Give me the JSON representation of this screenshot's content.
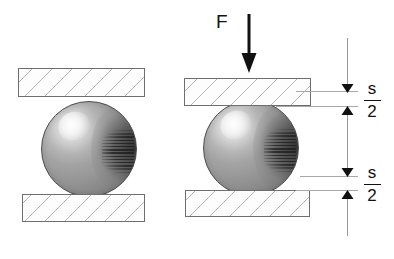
{
  "figure": {
    "background_color": "#ffffff",
    "force": {
      "label": "F",
      "direction": "down"
    },
    "dimensions": [
      {
        "id": "upper",
        "numerator": "s",
        "denominator": "2",
        "label": "s/2"
      },
      {
        "id": "lower",
        "numerator": "s",
        "denominator": "2",
        "label": "s/2"
      }
    ],
    "panels": [
      {
        "id": "undeformed",
        "caption": "",
        "plates": [
          {
            "id": "top-plate",
            "hatched": true
          },
          {
            "id": "bottom-plate",
            "hatched": true
          }
        ],
        "sphere": {
          "id": "sphere",
          "compressed": false
        }
      },
      {
        "id": "deformed",
        "caption": "",
        "plates": [
          {
            "id": "top-plate",
            "hatched": true
          },
          {
            "id": "bottom-plate",
            "hatched": true
          }
        ],
        "sphere": {
          "id": "sphere",
          "compressed": true
        }
      }
    ],
    "colors": {
      "plate_outline": "#6e6e6e",
      "hatch": "#a8a8a8",
      "sphere_dark": "#5e5e5e",
      "sphere_light": "#f2f2f2",
      "arrow": "#111111",
      "dimension_line": "#9a9a9a",
      "text": "#111111"
    }
  }
}
